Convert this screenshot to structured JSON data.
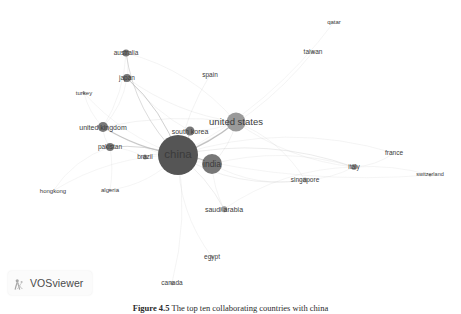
{
  "figure": {
    "width": 461,
    "height": 314,
    "background": "#ffffff",
    "type": "network-map",
    "tool": "VOSviewer"
  },
  "logo": {
    "text": "VOSviewer",
    "icon": "vosviewer-network-glyph-icon"
  },
  "caption": {
    "label": "Figure 4.5",
    "text": "The top ten collaborating countries with china"
  },
  "colors": {
    "node_dark": "#555555",
    "node_mid": "#777777",
    "node_light": "#9a9a9a",
    "node_faint": "#b9b9b9",
    "edge": "#b0b0b0",
    "label_text": "#3b3b3b",
    "background": "#ffffff"
  },
  "chart_data": {
    "type": "scatter",
    "title": "",
    "xlabel": "",
    "ylabel": "",
    "grid": false,
    "legend": "none",
    "xlim": [
      0,
      461
    ],
    "ylim": [
      0,
      294
    ],
    "nodes": [
      {
        "id": "china",
        "label": "china",
        "x": 178,
        "y": 155,
        "r": 20.0,
        "font": 11.5,
        "color": "#555555",
        "label_dx": 0,
        "label_dy": 0
      },
      {
        "id": "united-states",
        "label": "united states",
        "x": 236,
        "y": 122,
        "r": 9.5,
        "font": 9.5,
        "color": "#9a9a9a",
        "label_dx": 0,
        "label_dy": -0.5
      },
      {
        "id": "india",
        "label": "india",
        "x": 212,
        "y": 164,
        "r": 10.0,
        "font": 8.5,
        "color": "#777777",
        "label_dx": 0,
        "label_dy": 0
      },
      {
        "id": "south-korea",
        "label": "south korea",
        "x": 190,
        "y": 131,
        "r": 4.5,
        "font": 7.0,
        "color": "#777777",
        "label_dx": 0,
        "label_dy": 0
      },
      {
        "id": "united-kingdom",
        "label": "united kingdom",
        "x": 103,
        "y": 127,
        "r": 5.0,
        "font": 7.0,
        "color": "#777777",
        "label_dx": 0,
        "label_dy": 0
      },
      {
        "id": "japan",
        "label": "japan",
        "x": 127,
        "y": 78,
        "r": 4.0,
        "font": 6.5,
        "color": "#777777",
        "label_dx": 0,
        "label_dy": 0
      },
      {
        "id": "australia",
        "label": "australia",
        "x": 126,
        "y": 53,
        "r": 3.5,
        "font": 6.5,
        "color": "#777777",
        "label_dx": 0,
        "label_dy": 0
      },
      {
        "id": "pakistan",
        "label": "pakistan",
        "x": 110,
        "y": 147,
        "r": 4.0,
        "font": 6.5,
        "color": "#777777",
        "label_dx": 0,
        "label_dy": 0
      },
      {
        "id": "italy",
        "label": "italy",
        "x": 354,
        "y": 167,
        "r": 3.0,
        "font": 6.5,
        "color": "#9a9a9a",
        "label_dx": 0,
        "label_dy": 0
      },
      {
        "id": "singapore",
        "label": "singapore",
        "x": 305,
        "y": 180,
        "r": 2.5,
        "font": 6.5,
        "color": "#b9b9b9",
        "label_dx": 0,
        "label_dy": 0
      },
      {
        "id": "saudi-arabia",
        "label": "saudi arabia",
        "x": 224,
        "y": 209,
        "r": 2.8,
        "font": 7.0,
        "color": "#9a9a9a",
        "label_dx": 0,
        "label_dy": 0
      },
      {
        "id": "brazil",
        "label": "brazil",
        "x": 145,
        "y": 157,
        "r": 2.5,
        "font": 6.5,
        "color": "#9a9a9a",
        "label_dx": 0,
        "label_dy": 0
      },
      {
        "id": "spain",
        "label": "spain",
        "x": 210,
        "y": 75,
        "r": 0.0,
        "font": 6.5,
        "color": "#b9b9b9",
        "label_dx": 0,
        "label_dy": 0
      },
      {
        "id": "taiwan",
        "label": "taiwan",
        "x": 313,
        "y": 52,
        "r": 1.6,
        "font": 6.5,
        "color": "#b9b9b9",
        "label_dx": 0,
        "label_dy": 0
      },
      {
        "id": "qatar",
        "label": "qatar",
        "x": 334,
        "y": 22,
        "r": 0.0,
        "font": 6.0,
        "color": "#b9b9b9",
        "label_dx": 0,
        "label_dy": 0
      },
      {
        "id": "france",
        "label": "france",
        "x": 394,
        "y": 153,
        "r": 0.0,
        "font": 6.5,
        "color": "#b9b9b9",
        "label_dx": 0,
        "label_dy": 0
      },
      {
        "id": "switzerland",
        "label": "switzerland",
        "x": 430,
        "y": 175,
        "r": 1.4,
        "font": 5.5,
        "color": "#b9b9b9",
        "label_dx": 0,
        "label_dy": 0
      },
      {
        "id": "turkey",
        "label": "turkey",
        "x": 84,
        "y": 93,
        "r": 1.4,
        "font": 6.0,
        "color": "#b9b9b9",
        "label_dx": 0,
        "label_dy": 0
      },
      {
        "id": "egypt",
        "label": "egypt",
        "x": 212,
        "y": 257,
        "r": 1.6,
        "font": 6.5,
        "color": "#b9b9b9",
        "label_dx": 0,
        "label_dy": 0
      },
      {
        "id": "canada",
        "label": "canada",
        "x": 172,
        "y": 283,
        "r": 1.8,
        "font": 6.5,
        "color": "#b9b9b9",
        "label_dx": 0,
        "label_dy": 0
      },
      {
        "id": "hongkong",
        "label": "hongkong",
        "x": 53,
        "y": 191,
        "r": 0.0,
        "font": 6.0,
        "color": "#b9b9b9",
        "label_dx": 0,
        "label_dy": 0
      },
      {
        "id": "algeria",
        "label": "algeria",
        "x": 110,
        "y": 190,
        "r": 1.2,
        "font": 6.0,
        "color": "#b9b9b9",
        "label_dx": 0,
        "label_dy": 0
      }
    ],
    "edges": [
      {
        "source": "china",
        "target": "united-states",
        "weight": 3.0
      },
      {
        "source": "china",
        "target": "india",
        "weight": 2.6
      },
      {
        "source": "china",
        "target": "south-korea",
        "weight": 2.0
      },
      {
        "source": "china",
        "target": "united-kingdom",
        "weight": 2.4
      },
      {
        "source": "china",
        "target": "japan",
        "weight": 2.2
      },
      {
        "source": "china",
        "target": "australia",
        "weight": 1.8
      },
      {
        "source": "china",
        "target": "pakistan",
        "weight": 2.0
      },
      {
        "source": "china",
        "target": "italy",
        "weight": 1.2
      },
      {
        "source": "china",
        "target": "singapore",
        "weight": 1.0
      },
      {
        "source": "china",
        "target": "saudi-arabia",
        "weight": 1.1
      },
      {
        "source": "china",
        "target": "brazil",
        "weight": 1.0
      },
      {
        "source": "china",
        "target": "spain",
        "weight": 0.8
      },
      {
        "source": "china",
        "target": "taiwan",
        "weight": 0.6
      },
      {
        "source": "china",
        "target": "france",
        "weight": 0.6
      },
      {
        "source": "china",
        "target": "switzerland",
        "weight": 0.5
      },
      {
        "source": "china",
        "target": "turkey",
        "weight": 0.5
      },
      {
        "source": "china",
        "target": "egypt",
        "weight": 0.6
      },
      {
        "source": "china",
        "target": "canada",
        "weight": 0.7
      },
      {
        "source": "china",
        "target": "hongkong",
        "weight": 0.5
      },
      {
        "source": "china",
        "target": "algeria",
        "weight": 0.5
      },
      {
        "source": "china",
        "target": "qatar",
        "weight": 0.4
      },
      {
        "source": "united-states",
        "target": "india",
        "weight": 0.9
      },
      {
        "source": "united-states",
        "target": "united-kingdom",
        "weight": 0.9
      },
      {
        "source": "united-states",
        "target": "japan",
        "weight": 0.8
      },
      {
        "source": "united-states",
        "target": "australia",
        "weight": 0.7
      },
      {
        "source": "united-states",
        "target": "south-korea",
        "weight": 0.7
      },
      {
        "source": "united-states",
        "target": "italy",
        "weight": 0.7
      },
      {
        "source": "united-states",
        "target": "singapore",
        "weight": 0.6
      },
      {
        "source": "india",
        "target": "saudi-arabia",
        "weight": 0.7
      },
      {
        "source": "india",
        "target": "italy",
        "weight": 0.6
      },
      {
        "source": "india",
        "target": "singapore",
        "weight": 0.6
      },
      {
        "source": "india",
        "target": "united-kingdom",
        "weight": 0.7
      },
      {
        "source": "italy",
        "target": "france",
        "weight": 0.6
      },
      {
        "source": "italy",
        "target": "switzerland",
        "weight": 0.5
      },
      {
        "source": "japan",
        "target": "australia",
        "weight": 0.8
      },
      {
        "source": "japan",
        "target": "united-kingdom",
        "weight": 0.7
      },
      {
        "source": "japan",
        "target": "south-korea",
        "weight": 0.6
      },
      {
        "source": "australia",
        "target": "united-kingdom",
        "weight": 0.6
      },
      {
        "source": "united-kingdom",
        "target": "pakistan",
        "weight": 0.8
      },
      {
        "source": "pakistan",
        "target": "brazil",
        "weight": 0.5
      },
      {
        "source": "turkey",
        "target": "united-kingdom",
        "weight": 0.4
      },
      {
        "source": "hongkong",
        "target": "pakistan",
        "weight": 0.4
      },
      {
        "source": "singapore",
        "target": "italy",
        "weight": 0.5
      },
      {
        "source": "saudi-arabia",
        "target": "italy",
        "weight": 0.4
      },
      {
        "source": "algeria",
        "target": "pakistan",
        "weight": 0.4
      }
    ]
  }
}
